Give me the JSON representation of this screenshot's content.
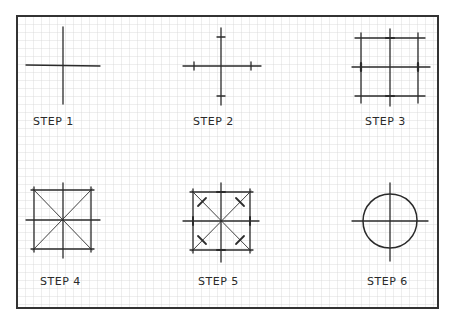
{
  "diagram": {
    "frame": {
      "x": 17,
      "y": 16,
      "width": 421,
      "height": 292,
      "stroke": "#333333"
    },
    "grid": {
      "spacing": 8,
      "color": "#d4d4d4"
    },
    "ink_color": "#2b2b2b",
    "steps": [
      {
        "label": "STEP 1",
        "description": "Draw horizontal and vertical center lines"
      },
      {
        "label": "STEP 2",
        "description": "Mark radius distance on each center line"
      },
      {
        "label": "STEP 3",
        "description": "Draw square through radius marks"
      },
      {
        "label": "STEP 4",
        "description": "Draw diagonals of the square"
      },
      {
        "label": "STEP 5",
        "description": "Mark radius distance on diagonals"
      },
      {
        "label": "STEP 6",
        "description": "Sketch circle through all marks"
      }
    ]
  }
}
